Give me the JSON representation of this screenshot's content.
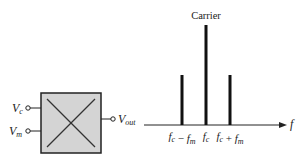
{
  "mixer": {
    "inputs": [
      {
        "symbol": "V",
        "subscript": "c"
      },
      {
        "symbol": "V",
        "subscript": "m"
      }
    ],
    "output": {
      "symbol": "V",
      "subscript": "out"
    }
  },
  "spectrum": {
    "axis_label": "f",
    "carrier_label": "Carrier",
    "lines": [
      {
        "name": "lower-sideband",
        "label_parts": [
          [
            "f",
            "c"
          ],
          [
            " − ",
            ""
          ],
          [
            "f",
            "m"
          ]
        ],
        "relative_amplitude": 0.5
      },
      {
        "name": "carrier",
        "label_parts": [
          [
            "f",
            "c"
          ]
        ],
        "relative_amplitude": 1.0
      },
      {
        "name": "upper-sideband",
        "label_parts": [
          [
            "f",
            "c"
          ],
          [
            " + ",
            ""
          ],
          [
            "f",
            "m"
          ]
        ],
        "relative_amplitude": 0.5
      }
    ]
  },
  "colors": {
    "box_fill": "#d4d4d4",
    "stroke": "#222222",
    "bar": "#111111"
  }
}
